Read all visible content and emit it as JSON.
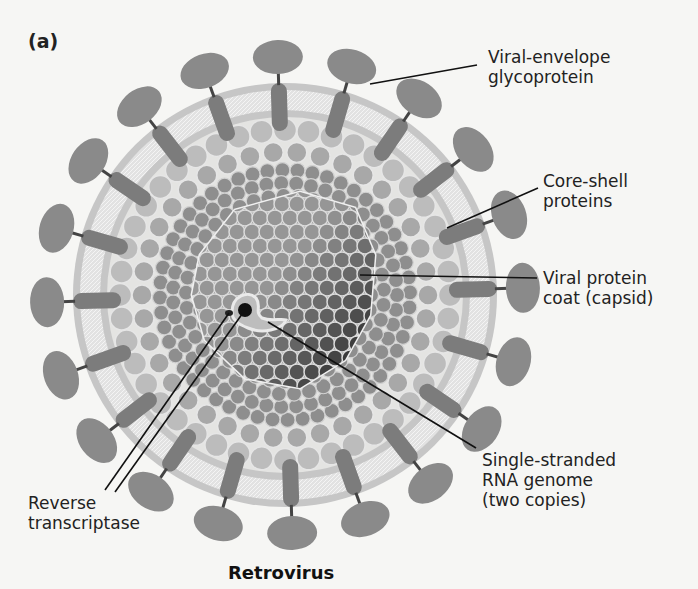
{
  "figure": {
    "panel_label": "(a)",
    "title": "Retrovirus",
    "colors": {
      "background": "#f6f6f4",
      "spike_head": "#8a8a8a",
      "spike_stem": "#7a7a7a",
      "membrane_outer": "#c4c4c4",
      "membrane_inner": "#dcdcdc",
      "core_shell_beads": "#b8b8b8",
      "matrix_beads": "#8e8e8e",
      "capsid_light": "#9a9a9a",
      "capsid_dark": "#3c3c3c",
      "leader_line": "#111111"
    },
    "labels": [
      {
        "id": "viral-envelope-glycoprotein",
        "lines": [
          "Viral-envelope",
          "glycoprotein"
        ]
      },
      {
        "id": "core-shell-proteins",
        "lines": [
          "Core-shell",
          "proteins"
        ]
      },
      {
        "id": "viral-protein-coat",
        "lines": [
          "Viral protein",
          "coat (capsid)"
        ]
      },
      {
        "id": "rna-genome",
        "lines": [
          "Single-stranded",
          "RNA genome",
          "(two copies)"
        ]
      },
      {
        "id": "reverse-transcriptase",
        "lines": [
          "Reverse",
          "transcriptase"
        ]
      }
    ]
  }
}
